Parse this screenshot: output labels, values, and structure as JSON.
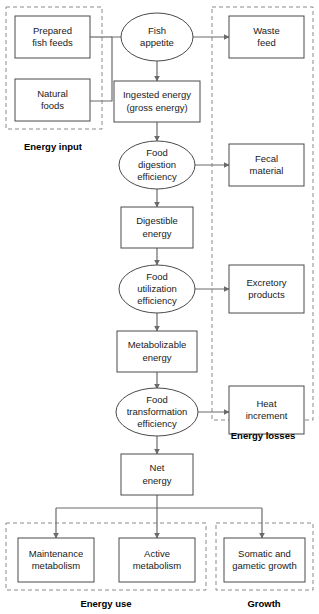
{
  "diagram": {
    "colors": {
      "node_stroke": "#4a4a4a",
      "group_stroke": "#8a8a8a",
      "edge_stroke": "#6a6a6a",
      "text": "#1a1a1a",
      "background": "#ffffff"
    },
    "nodes": [
      {
        "id": "prepared_fish_feeds",
        "shape": "rect",
        "lines": [
          "Prepared",
          "fish feeds"
        ]
      },
      {
        "id": "natural_foods",
        "shape": "rect",
        "lines": [
          "Natural",
          "foods"
        ]
      },
      {
        "id": "fish_appetite",
        "shape": "ellipse",
        "lines": [
          "Fish",
          "appetite"
        ]
      },
      {
        "id": "ingested_energy",
        "shape": "rect",
        "lines": [
          "Ingested energy",
          "(gross energy)"
        ]
      },
      {
        "id": "food_digestion_efficiency",
        "shape": "ellipse",
        "lines": [
          "Food",
          "digestion",
          "efficiency"
        ]
      },
      {
        "id": "digestible_energy",
        "shape": "rect",
        "lines": [
          "Digestible",
          "energy"
        ]
      },
      {
        "id": "food_utilization_efficiency",
        "shape": "ellipse",
        "lines": [
          "Food",
          "utilization",
          "efficiency"
        ]
      },
      {
        "id": "metabolizable_energy",
        "shape": "rect",
        "lines": [
          "Metabolizable",
          "energy"
        ]
      },
      {
        "id": "food_transformation_efficiency",
        "shape": "ellipse",
        "lines": [
          "Food",
          "transformation",
          "efficiency"
        ]
      },
      {
        "id": "net_energy",
        "shape": "rect",
        "lines": [
          "Net",
          "energy"
        ]
      },
      {
        "id": "waste_feed",
        "shape": "rect",
        "lines": [
          "Waste",
          "feed"
        ]
      },
      {
        "id": "fecal_material",
        "shape": "rect",
        "lines": [
          "Fecal",
          "material"
        ]
      },
      {
        "id": "excretory_products",
        "shape": "rect",
        "lines": [
          "Excretory",
          "products"
        ]
      },
      {
        "id": "heat_increment",
        "shape": "rect",
        "lines": [
          "Heat",
          "increment"
        ]
      },
      {
        "id": "maintenance_metabolism",
        "shape": "rect",
        "lines": [
          "Maintenance",
          "metabolism"
        ]
      },
      {
        "id": "active_metabolism",
        "shape": "rect",
        "lines": [
          "Active",
          "metabolism"
        ]
      },
      {
        "id": "somatic_gametic_growth",
        "shape": "rect",
        "lines": [
          "Somatic and",
          "gametic growth"
        ]
      }
    ],
    "groups": [
      {
        "id": "energy_input",
        "label": "Energy input"
      },
      {
        "id": "energy_losses",
        "label": "Energy losses"
      },
      {
        "id": "energy_use",
        "label": "Energy use"
      },
      {
        "id": "growth",
        "label": "Growth"
      }
    ],
    "edges": [
      {
        "from": "prepared_fish_feeds",
        "to": "fish_appetite"
      },
      {
        "from": "natural_foods",
        "to": "fish_appetite"
      },
      {
        "from": "fish_appetite",
        "to": "waste_feed"
      },
      {
        "from": "fish_appetite",
        "to": "ingested_energy"
      },
      {
        "from": "ingested_energy",
        "to": "food_digestion_efficiency"
      },
      {
        "from": "food_digestion_efficiency",
        "to": "fecal_material"
      },
      {
        "from": "food_digestion_efficiency",
        "to": "digestible_energy"
      },
      {
        "from": "digestible_energy",
        "to": "food_utilization_efficiency"
      },
      {
        "from": "food_utilization_efficiency",
        "to": "excretory_products"
      },
      {
        "from": "food_utilization_efficiency",
        "to": "metabolizable_energy"
      },
      {
        "from": "metabolizable_energy",
        "to": "food_transformation_efficiency"
      },
      {
        "from": "food_transformation_efficiency",
        "to": "heat_increment"
      },
      {
        "from": "food_transformation_efficiency",
        "to": "net_energy"
      },
      {
        "from": "net_energy",
        "to": "maintenance_metabolism"
      },
      {
        "from": "net_energy",
        "to": "active_metabolism"
      },
      {
        "from": "net_energy",
        "to": "somatic_gametic_growth"
      }
    ]
  }
}
